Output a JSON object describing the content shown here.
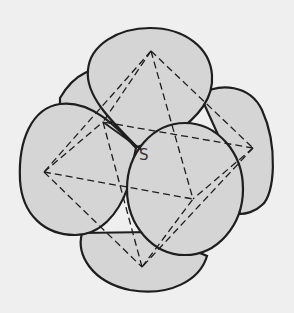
{
  "figure": {
    "label": "S",
    "colors": {
      "background": "#efefef",
      "lobe_fill": "#d5d5d5",
      "stroke": "#1e1e1e"
    },
    "vertices": {
      "top": [
        151,
        51
      ],
      "left": [
        44,
        172
      ],
      "right": [
        253,
        148
      ],
      "bottom": [
        142,
        267
      ],
      "back_left": [
        103,
        122
      ],
      "front_right": [
        193,
        199
      ]
    }
  }
}
